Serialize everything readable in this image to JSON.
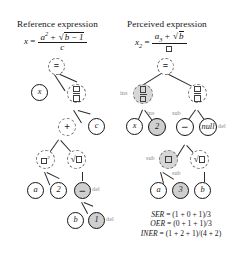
{
  "figure": {
    "panels": [
      {
        "id": "reference",
        "title": "Reference expression",
        "equation": {
          "lhs": "x",
          "rel": "=",
          "numerator": "a² + √b − 1",
          "denominator": "c"
        }
      },
      {
        "id": "perceived",
        "title": "Perceived expression",
        "equation": {
          "lhs": "x₂",
          "rel": "=",
          "numerator": "a₃ + √b",
          "denominator": "□"
        }
      }
    ]
  },
  "reference_tree": {
    "nodes": [
      {
        "id": "r-eq",
        "label": "=",
        "kind": "op",
        "style": "dashed"
      },
      {
        "id": "r-x",
        "label": "x",
        "kind": "var",
        "style": "solid"
      },
      {
        "id": "r-frac",
        "label": "□/□",
        "kind": "fraction",
        "style": "dashed"
      },
      {
        "id": "r-plus",
        "label": "+",
        "kind": "op",
        "style": "dashed"
      },
      {
        "id": "r-c",
        "label": "c",
        "kind": "var",
        "style": "solid"
      },
      {
        "id": "r-pow",
        "label": "□²",
        "kind": "power",
        "style": "dashed"
      },
      {
        "id": "r-sqrt",
        "label": "√□",
        "kind": "radical",
        "style": "dashed"
      },
      {
        "id": "r-a",
        "label": "a",
        "kind": "var",
        "style": "solid"
      },
      {
        "id": "r-2",
        "label": "2",
        "kind": "num",
        "style": "solid"
      },
      {
        "id": "r-minus",
        "label": "−",
        "kind": "op",
        "style": "solid-filled"
      },
      {
        "id": "r-b",
        "label": "b",
        "kind": "var",
        "style": "solid"
      },
      {
        "id": "r-1",
        "label": "1",
        "kind": "num",
        "style": "solid-filled"
      }
    ],
    "op_labels": [
      {
        "id": "r-del-minus",
        "text": "del"
      },
      {
        "id": "r-del-one",
        "text": "del"
      }
    ]
  },
  "perceived_tree": {
    "nodes": [
      {
        "id": "p-eq",
        "label": "=",
        "kind": "op",
        "style": "dashed"
      },
      {
        "id": "p-frac1",
        "label": "□/□",
        "kind": "fraction-ins",
        "style": "dashed-filled"
      },
      {
        "id": "p-frac2",
        "label": "□/□",
        "kind": "fraction",
        "style": "dashed"
      },
      {
        "id": "p-x",
        "label": "x",
        "kind": "var",
        "style": "solid"
      },
      {
        "id": "p-2",
        "label": "2",
        "kind": "num",
        "style": "solid-filled"
      },
      {
        "id": "p-minus",
        "label": "−",
        "kind": "op",
        "style": "solid"
      },
      {
        "id": "p-null",
        "label": "null",
        "kind": "null",
        "style": "solid"
      },
      {
        "id": "p-box",
        "label": "□",
        "kind": "boxsub",
        "style": "dashed-filled"
      },
      {
        "id": "p-sqrt",
        "label": "√□",
        "kind": "radical",
        "style": "dashed"
      },
      {
        "id": "p-a",
        "label": "a",
        "kind": "var",
        "style": "solid"
      },
      {
        "id": "p-3",
        "label": "3",
        "kind": "num",
        "style": "solid-filled"
      },
      {
        "id": "p-b",
        "label": "b",
        "kind": "var",
        "style": "solid"
      }
    ],
    "op_labels": [
      {
        "id": "p-ins-frac",
        "text": "ins"
      },
      {
        "id": "p-ins-2",
        "text": "ins"
      },
      {
        "id": "p-sub-minus",
        "text": "sub"
      },
      {
        "id": "p-del-null",
        "text": "del"
      },
      {
        "id": "p-sub-box",
        "text": "sub"
      },
      {
        "id": "p-sub-3",
        "text": "sub"
      }
    ]
  },
  "metrics": {
    "lines": [
      {
        "name": "SER",
        "expr": "= (1 + 0 + 1)/3"
      },
      {
        "name": "OER",
        "expr": "= (0 + 1 + 1)/3"
      },
      {
        "name": "INER",
        "expr": "= (1 + 2 + 1)/(4 + 2)"
      }
    ]
  },
  "colors": {
    "ink": "#141414",
    "dashed_node": "#6e6e6e",
    "fill_grey": "#cfcfcf",
    "op_label": "#8a8a8a"
  }
}
